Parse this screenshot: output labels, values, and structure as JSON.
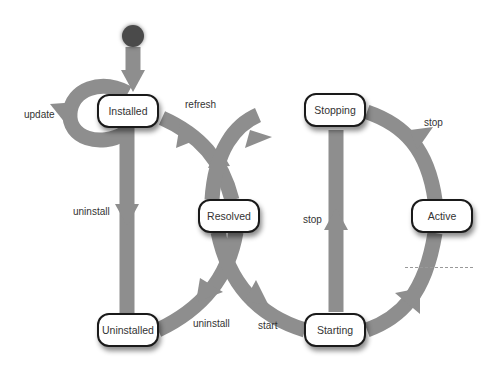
{
  "diagram": {
    "type": "state-machine",
    "colors": {
      "edge": "#8e8e8e",
      "node_border": "#1a1a1a",
      "start": "#4a4a4a",
      "dash": "#999999"
    },
    "states": {
      "installed": "Installed",
      "resolved": "Resolved",
      "uninstalled": "Uninstalled",
      "starting": "Starting",
      "stopping": "Stopping",
      "active": "Active"
    },
    "transitions": {
      "update": "update",
      "refresh": "refresh",
      "uninstall_installed": "uninstall",
      "uninstall_resolved": "uninstall",
      "start": "start",
      "stop_active": "stop",
      "stop_starting": "stop"
    }
  }
}
